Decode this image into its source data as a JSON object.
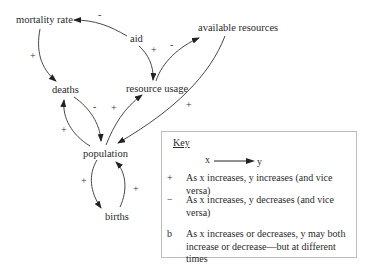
{
  "nodes": {
    "mortality_rate": "mortality rate",
    "aid": "aid",
    "available_resources": "available resources",
    "deaths": "deaths",
    "resource_usage": "resource usage",
    "population": "population",
    "births": "births"
  },
  "edges": [
    {
      "from": "aid",
      "to": "mortality rate",
      "sign": "-"
    },
    {
      "from": "mortality rate",
      "to": "deaths",
      "sign": "+"
    },
    {
      "from": "aid",
      "to": "resource usage",
      "sign": "+"
    },
    {
      "from": "resource usage",
      "to": "available resources",
      "sign": "-"
    },
    {
      "from": "available resources",
      "to": "population",
      "sign": "+"
    },
    {
      "from": "deaths",
      "to": "population",
      "sign": "-"
    },
    {
      "from": "population",
      "to": "deaths",
      "sign": "+"
    },
    {
      "from": "population",
      "to": "resource usage",
      "sign": "+"
    },
    {
      "from": "population",
      "to": "births",
      "sign": "+"
    },
    {
      "from": "births",
      "to": "population",
      "sign": "+"
    }
  ],
  "signs": {
    "aid_mortality": "-",
    "mortality_deaths": "+",
    "aid_usage": "+",
    "usage_available": "-",
    "available_population": "+",
    "deaths_population": "-",
    "population_deaths": "+",
    "population_usage": "+",
    "population_births": "+",
    "births_population": "+"
  },
  "key": {
    "title": "Key",
    "x_label": "x",
    "y_label": "y",
    "rows": [
      {
        "symbol": "+",
        "text": "As x increases, y increases (and vice versa)"
      },
      {
        "symbol": "−",
        "text": "As x increases, y decreases (and vice versa)"
      },
      {
        "symbol": "b",
        "text": "As x increases or decreases, y may both increase or decrease—but at different times"
      }
    ]
  }
}
